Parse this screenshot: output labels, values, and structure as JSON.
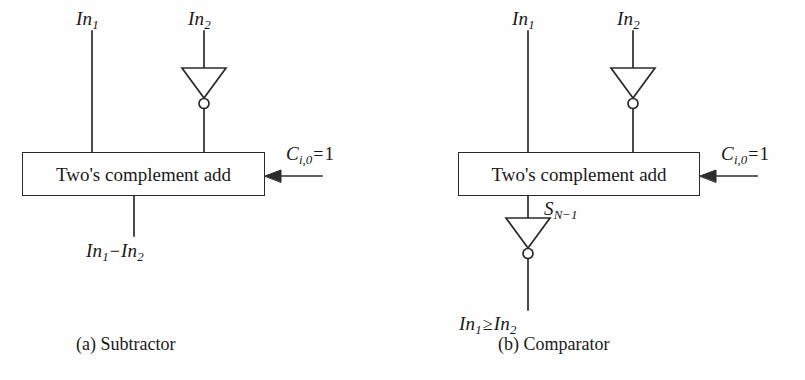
{
  "figure": {
    "background_color": "#fefefe",
    "line_color": "#2b2b2b",
    "text_color": "#1a1a1a"
  },
  "panels": [
    {
      "id": "a",
      "caption": "(a) Subtractor",
      "block_label": "Two's complement add",
      "inputs": [
        {
          "name": "In",
          "sub": "1"
        },
        {
          "name": "In",
          "sub": "2"
        }
      ],
      "carry_in": {
        "name": "C",
        "sub": "i,0",
        "operator": "=",
        "value": "1"
      },
      "output": {
        "left": {
          "name": "In",
          "sub": "1"
        },
        "operator": "−",
        "right": {
          "name": "In",
          "sub": "2"
        }
      },
      "inverters": 1
    },
    {
      "id": "b",
      "caption": "(b) Comparator",
      "block_label": "Two's complement add",
      "inputs": [
        {
          "name": "In",
          "sub": "1"
        },
        {
          "name": "In",
          "sub": "2"
        }
      ],
      "carry_in": {
        "name": "C",
        "sub": "i,0",
        "operator": "=",
        "value": "1"
      },
      "sum_tap": {
        "name": "S",
        "sub": "N−1"
      },
      "output": {
        "left": {
          "name": "In",
          "sub": "1"
        },
        "operator": "≥",
        "right": {
          "name": "In",
          "sub": "2"
        }
      },
      "inverters": 2
    }
  ]
}
